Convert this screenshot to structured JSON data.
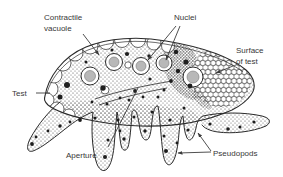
{
  "figure": {
    "kind": "biology-line-diagram",
    "background_color": "#ffffff",
    "ink_color": "#2b2b2b",
    "label_text_color": "#383838"
  },
  "labels": {
    "contractile_vacuole": {
      "line1": "Contractile",
      "line2": "vacuole"
    },
    "nuclei": {
      "text": "Nuclei"
    },
    "surface_of_test": {
      "line1": "Surface",
      "line2": "of test"
    },
    "test": {
      "text": "Test"
    },
    "aperture": {
      "text": "Aperture"
    },
    "pseudopods": {
      "text": "Pseudopods"
    }
  }
}
